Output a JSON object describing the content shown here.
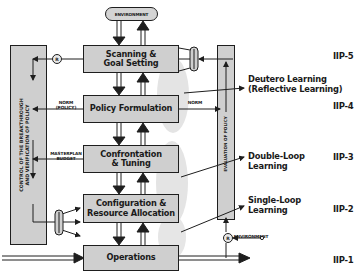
{
  "diagram": {
    "environment_top": "ENVIRONMENT",
    "environment_bottom": "ENVIRONMENT",
    "boxes": [
      {
        "id": "scanning",
        "label": "Scanning & Goal Setting",
        "line1": "Scanning &",
        "line2": "Goal Setting"
      },
      {
        "id": "policy",
        "label": "Policy Formulation",
        "line1": "Policy Formulation",
        "line2": ""
      },
      {
        "id": "confrontation",
        "label": "Confrontation & Tuning",
        "line1": "Confrontation",
        "line2": "& Tuning"
      },
      {
        "id": "configuration",
        "label": "Configuration & Resource Allocation",
        "line1": "Configuration &",
        "line2": "Resource Allocation"
      },
      {
        "id": "operations",
        "label": "Operations",
        "line1": "Operations",
        "line2": ""
      }
    ],
    "left_panel": {
      "line1": "CONTROL OF THE BREAKTHROUGH",
      "line2": "AND VERIFICATION OF POLICY"
    },
    "right_panel": {
      "text": "EVALUATION OF POLICY"
    },
    "side_labels": {
      "norm_policy_1": "NORM",
      "norm_policy_2": "(POLICY)",
      "masterplan": "MASTERPLAN",
      "budget": "BUDGET",
      "norm_right": "NORM"
    },
    "comparator_symbol": "®",
    "learning_labels": [
      {
        "line1": "Deutero Learning",
        "line2": "(Reflective Learning)"
      },
      {
        "line1": "Double-Loop",
        "line2": "Learning"
      },
      {
        "line1": "Single-Loop",
        "line2": "Learning"
      }
    ],
    "levels": [
      "IIP-5",
      "IIP-4",
      "IIP-3",
      "IIP-2",
      "IIP-1"
    ],
    "colors": {
      "box_fill": "#cfcfcf",
      "stroke": "#1e1e1e",
      "blob": "#e6e6e6",
      "background": "#ffffff"
    }
  }
}
